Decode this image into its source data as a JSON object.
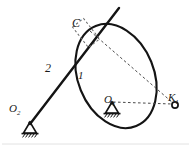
{
  "figure": {
    "type": "mechanism-kinematic-diagram",
    "background": "#ffffff",
    "ink": "#141414",
    "dash_color": "#4a4a4a",
    "width": 191,
    "height": 146
  },
  "labels": {
    "point_c": {
      "text": "C",
      "sub": "",
      "x": 72,
      "y": 17
    },
    "point_o1": {
      "text": "O",
      "sub": "1",
      "x": 104,
      "y": 94
    },
    "point_o2": {
      "text": "O",
      "sub": "2",
      "x": 9,
      "y": 103
    },
    "point_k1": {
      "text": "K",
      "sub": "1",
      "x": 168,
      "y": 92
    },
    "link_1": {
      "text": "1",
      "x": 78,
      "y": 70
    },
    "link_2": {
      "text": "2",
      "x": 45,
      "y": 62
    }
  },
  "geometry": {
    "ellipse": {
      "name": "link-1-cam-body",
      "cx": 116,
      "cy": 76,
      "rx": 38,
      "ry": 54,
      "rotation": -22
    },
    "link2_line": {
      "name": "link-2-rocker",
      "x1": 30,
      "y1": 124,
      "x2": 119,
      "y2": 8
    },
    "pivot_o1": {
      "x": 112,
      "y": 104
    },
    "pivot_o2": {
      "x": 30,
      "y": 124
    },
    "point_c": {
      "x": 85,
      "y": 34
    },
    "point_k1": {
      "x": 175,
      "y": 105
    },
    "slider_block": {
      "name": "slider-at-c",
      "cx": 86,
      "cy": 33,
      "w": 14,
      "h": 26,
      "rotation": -38
    },
    "dashed_c_to_k1": {
      "x1": 90,
      "y1": 31,
      "x2": 173,
      "y2": 103
    },
    "dashed_o1_to_k1": {
      "x1": 113,
      "y1": 102,
      "x2": 172,
      "y2": 104
    }
  },
  "legend": {
    "ground_support_label": "fixed-pivot-ground",
    "slider_label": "prismatic-slider"
  }
}
